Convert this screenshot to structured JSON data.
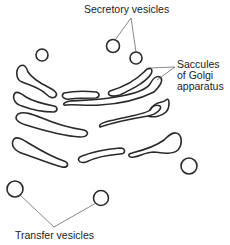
{
  "diagram": {
    "subject": "Golgi apparatus",
    "labels": {
      "secretory_vesicles": "Secretory vesicles",
      "saccules": [
        "Saccules",
        "of Golgi",
        "apparatus"
      ],
      "transfer_vesicles": "Transfer vesicles"
    },
    "colors": {
      "outline": "#2a2a2a",
      "leader_line": "#555555",
      "background": "#ffffff"
    }
  }
}
